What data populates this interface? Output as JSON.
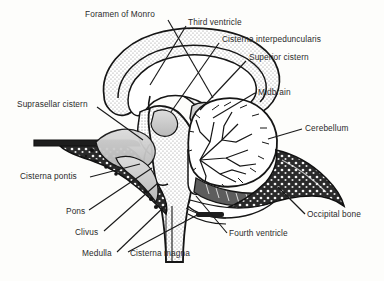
{
  "figure": {
    "type": "anatomical-diagram",
    "view": "mid-sagittal",
    "background_color": "#fdfdfb",
    "line_color": "#1a1a1a",
    "label_color": "#2b2b2b",
    "stipple_color": "#9a9a9a",
    "bone_color": "#1f1f1f",
    "cistern_shade": "#c9c9c9"
  },
  "labels": [
    {
      "id": "foramen-of-monro",
      "text": "Foramen of Monro",
      "x": 85,
      "y": 10,
      "align": "left",
      "leader": [
        [
          168,
          20
        ],
        [
          213,
          98
        ]
      ]
    },
    {
      "id": "third-ventricle",
      "text": "Third ventricle",
      "x": 188,
      "y": 18,
      "align": "left",
      "leader": [
        [
          186,
          26
        ],
        [
          150,
          85
        ]
      ]
    },
    {
      "id": "cisterna-interpeduncularis",
      "text": "Cisterna interpeduncularis",
      "x": 222,
      "y": 35,
      "align": "left",
      "leader": [
        [
          219,
          43
        ],
        [
          171,
          112
        ]
      ]
    },
    {
      "id": "superior-cistern",
      "text": "Superior cistern",
      "x": 249,
      "y": 53,
      "align": "left",
      "leader": [
        [
          246,
          61
        ],
        [
          200,
          110
        ]
      ]
    },
    {
      "id": "midbrain",
      "text": "Midbrain",
      "x": 258,
      "y": 88,
      "align": "left",
      "leader": [
        [
          255,
          93
        ],
        [
          213,
          118
        ]
      ]
    },
    {
      "id": "cerebellum",
      "text": "Cerebellum",
      "x": 305,
      "y": 124,
      "align": "left",
      "leader": [
        [
          302,
          129
        ],
        [
          268,
          139
        ]
      ]
    },
    {
      "id": "suprasellar-cistern",
      "text": "Suprasellar cistern",
      "x": 17,
      "y": 100,
      "align": "left",
      "leader": [
        [
          97,
          107
        ],
        [
          143,
          140
        ]
      ]
    },
    {
      "id": "cisterna-pontis",
      "text": "Cisterna pontis",
      "x": 20,
      "y": 172,
      "align": "left",
      "leader": [
        [
          90,
          177
        ],
        [
          140,
          164
        ]
      ]
    },
    {
      "id": "pons",
      "text": "Pons",
      "x": 66,
      "y": 207,
      "align": "left",
      "leader": [
        [
          89,
          210
        ],
        [
          152,
          168
        ]
      ]
    },
    {
      "id": "clivus",
      "text": "Clivus",
      "x": 75,
      "y": 228,
      "align": "left",
      "leader": [
        [
          104,
          231
        ],
        [
          158,
          183
        ]
      ]
    },
    {
      "id": "medulla",
      "text": "Medulla",
      "x": 82,
      "y": 249,
      "align": "left",
      "leader": [
        [
          117,
          252
        ],
        [
          166,
          205
        ]
      ]
    },
    {
      "id": "occipital-bone",
      "text": "Occipital bone",
      "x": 307,
      "y": 210,
      "align": "left",
      "leader": [
        [
          305,
          214
        ],
        [
          278,
          187
        ]
      ]
    },
    {
      "id": "fourth-ventricle",
      "text": "Fourth ventricle",
      "x": 229,
      "y": 229,
      "align": "left",
      "leader": [
        [
          227,
          233
        ],
        [
          196,
          196
        ]
      ]
    },
    {
      "id": "cisterna-magna",
      "text": "Cisterna magna",
      "x": 130,
      "y": 249,
      "align": "left",
      "leader": [
        [
          128,
          252
        ],
        [
          199,
          214
        ]
      ]
    }
  ]
}
